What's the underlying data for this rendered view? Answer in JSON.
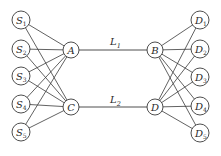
{
  "diagram": {
    "type": "network",
    "colors": {
      "stroke": "#3a3a3a",
      "text": "#2a2a2a",
      "background": "#ffffff",
      "node_fill": "#ffffff"
    },
    "nodes": [
      {
        "id": "S1",
        "base": "S",
        "sub": "1",
        "x": 21,
        "y": 20,
        "r": 9
      },
      {
        "id": "S2",
        "base": "S",
        "sub": "2",
        "x": 21,
        "y": 49,
        "r": 9
      },
      {
        "id": "S3",
        "base": "S",
        "sub": "3",
        "x": 21,
        "y": 76,
        "r": 9
      },
      {
        "id": "S4",
        "base": "S",
        "sub": "4",
        "x": 21,
        "y": 104,
        "r": 9
      },
      {
        "id": "S5",
        "base": "S",
        "sub": "5",
        "x": 21,
        "y": 132,
        "r": 9
      },
      {
        "id": "A",
        "base": "A",
        "sub": "",
        "x": 71,
        "y": 50,
        "r": 8
      },
      {
        "id": "C",
        "base": "C",
        "sub": "",
        "x": 71,
        "y": 107,
        "r": 8
      },
      {
        "id": "B",
        "base": "B",
        "sub": "",
        "x": 155,
        "y": 50,
        "r": 8
      },
      {
        "id": "D",
        "base": "D",
        "sub": "",
        "x": 155,
        "y": 107,
        "r": 8
      },
      {
        "id": "D1",
        "base": "D",
        "sub": "1",
        "x": 200,
        "y": 20,
        "r": 9
      },
      {
        "id": "D2",
        "base": "D",
        "sub": "2",
        "x": 200,
        "y": 49,
        "r": 9
      },
      {
        "id": "D3",
        "base": "D",
        "sub": "3",
        "x": 200,
        "y": 77,
        "r": 9
      },
      {
        "id": "D4",
        "base": "D",
        "sub": "4",
        "x": 200,
        "y": 106,
        "r": 9
      },
      {
        "id": "D5",
        "base": "D",
        "sub": "5",
        "x": 200,
        "y": 133,
        "r": 9
      }
    ],
    "links": [
      {
        "from": "A",
        "to": "B",
        "label_base": "L",
        "label_sub": "1",
        "label_x": 110,
        "label_y": 45
      },
      {
        "from": "C",
        "to": "D",
        "label_base": "L",
        "label_sub": "2",
        "label_x": 110,
        "label_y": 103
      }
    ],
    "edges": [
      [
        "S1",
        "A"
      ],
      [
        "S1",
        "C"
      ],
      [
        "S2",
        "A"
      ],
      [
        "S2",
        "C"
      ],
      [
        "S3",
        "A"
      ],
      [
        "S3",
        "C"
      ],
      [
        "S4",
        "A"
      ],
      [
        "S4",
        "C"
      ],
      [
        "S5",
        "A"
      ],
      [
        "S5",
        "C"
      ],
      [
        "B",
        "D1"
      ],
      [
        "B",
        "D2"
      ],
      [
        "B",
        "D3"
      ],
      [
        "B",
        "D4"
      ],
      [
        "B",
        "D5"
      ],
      [
        "D",
        "D1"
      ],
      [
        "D",
        "D2"
      ],
      [
        "D",
        "D3"
      ],
      [
        "D",
        "D4"
      ],
      [
        "D",
        "D5"
      ]
    ]
  }
}
